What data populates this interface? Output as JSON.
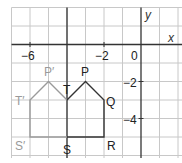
{
  "axes": {
    "x_label": "x",
    "y_label": "y",
    "x_ticks": [
      {
        "value": -6,
        "label": "−6"
      },
      {
        "value": -2,
        "label": "−2"
      },
      {
        "value": 0,
        "label": "0"
      }
    ],
    "y_ticks": [
      {
        "value": -2,
        "label": "−2"
      },
      {
        "value": -4,
        "label": "−4"
      }
    ],
    "grid_x_range": [
      -7,
      1
    ],
    "grid_y_range": [
      -6,
      2
    ]
  },
  "original": {
    "color": "#222222",
    "vertices": [
      {
        "name": "P",
        "x": -3,
        "y": -2
      },
      {
        "name": "Q",
        "x": -2,
        "y": -3
      },
      {
        "name": "R",
        "x": -2,
        "y": -5
      },
      {
        "name": "S",
        "x": -4,
        "y": -5
      },
      {
        "name": "T",
        "x": -4,
        "y": -3
      }
    ]
  },
  "image": {
    "color": "#999999",
    "vertices": [
      {
        "name": "P′",
        "x": -5,
        "y": -2
      },
      {
        "name": "T′",
        "x": -6,
        "y": -3
      },
      {
        "name": "S′",
        "x": -6,
        "y": -5
      }
    ]
  },
  "labels": {
    "P": "P",
    "Q": "Q",
    "R": "R",
    "S": "S",
    "T": "T",
    "P_prime": "P′",
    "T_prime": "T′",
    "S_prime": "S′"
  }
}
